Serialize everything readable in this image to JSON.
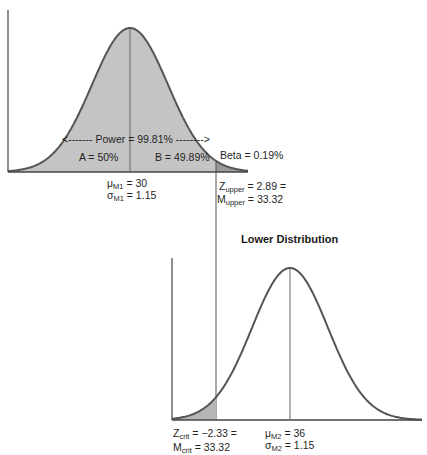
{
  "upper_distribution": {
    "power_label": "<------- Power = 99.81% -------->",
    "region_a": "A = 50%",
    "region_b": "B = 49.89%",
    "beta_label": "Beta = 0.19%",
    "mean": {
      "symbol": "μ",
      "sub": "M1",
      "value": " = 30"
    },
    "sd": {
      "symbol": "σ",
      "sub": "M1",
      "value": " = 1.15"
    },
    "z_upper": {
      "symbol": "Z",
      "sub": "upper",
      "value": " = 2.89 ="
    },
    "m_upper": {
      "symbol": "M",
      "sub": "upper",
      "value": " = 33.32"
    },
    "fill_color": "#c4c4c4",
    "tail_color": "#9a9a9a"
  },
  "lower_distribution": {
    "title": "Lower Distribution",
    "z_crit": {
      "symbol": "Z",
      "sub": "crit",
      "value": " = −2.33 ="
    },
    "m_crit": {
      "symbol": "M",
      "sub": "crit",
      "value": " =  33.32"
    },
    "mean": {
      "symbol": "μ",
      "sub": "M2",
      "value": " = 36"
    },
    "sd": {
      "symbol": "σ",
      "sub": "M2",
      "value": " = 1.15"
    },
    "tail_color": "#b5b5b5"
  },
  "chart_data": [
    {
      "type": "area",
      "title": "",
      "description": "Upper (null) normal distribution with shaded power region and beta tail",
      "mean": 30,
      "sd": 1.15,
      "cutoff_z": 2.89,
      "cutoff_m": 33.32,
      "regions": [
        {
          "name": "A",
          "percent": 50
        },
        {
          "name": "B",
          "percent": 49.89
        },
        {
          "name": "Power",
          "percent": 99.81
        },
        {
          "name": "Beta",
          "percent": 0.19
        }
      ]
    },
    {
      "type": "area",
      "title": "Lower Distribution",
      "mean": 36,
      "sd": 1.15,
      "cutoff_z": -2.33,
      "cutoff_m": 33.32
    }
  ]
}
